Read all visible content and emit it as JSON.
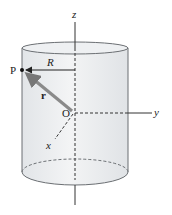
{
  "diagram": {
    "type": "cylinder-coordinate-sketch",
    "labels": {
      "z_axis": "z",
      "y_axis": "y",
      "x_axis": "x",
      "origin": "O",
      "point": "P",
      "radius": "R",
      "position_vector": "r⃗"
    },
    "colors": {
      "cylinder_fill": "#e9ecef",
      "cylinder_edge": "#6b6f73",
      "axis": "#333333",
      "vector": "#8a8a8a",
      "text": "#222222"
    }
  }
}
